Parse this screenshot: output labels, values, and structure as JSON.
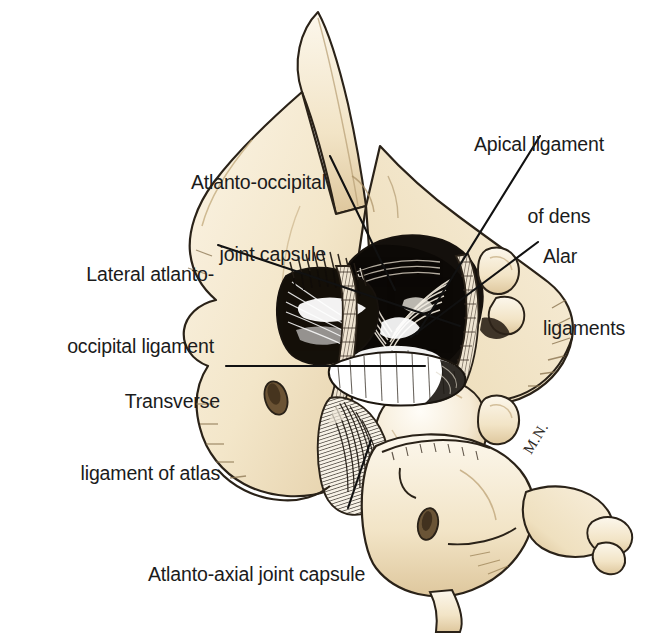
{
  "figure": {
    "kind": "anatomical-illustration",
    "signature": "M.N.",
    "background_color": "#FFFFFF",
    "ink_color": "#1B1B1B",
    "bone_fill": "#F4E7CD",
    "bone_fill_light": "#FAF3E4",
    "bone_fill_shadow": "#E2CEA8",
    "cavity_color": "#14100C",
    "ligament_white": "#FFFFFF"
  },
  "labels": [
    {
      "id": "atlanto-occipital-joint-capsule",
      "lines": [
        "Atlanto-occipital",
        "joint capsule"
      ],
      "align": "right",
      "x": 104,
      "y": 122,
      "width": 222,
      "leader": {
        "x1": 330,
        "y1": 156,
        "x2": 395,
        "y2": 290
      }
    },
    {
      "id": "lateral-atlanto-occipital-ligament",
      "lines": [
        "Lateral atlanto-",
        "occipital ligament"
      ],
      "align": "right",
      "x": 32,
      "y": 214,
      "width": 182,
      "leader": {
        "x1": 218,
        "y1": 245,
        "x2": 460,
        "y2": 326
      }
    },
    {
      "id": "transverse-ligament-of-atlas",
      "lines": [
        "Transverse",
        "ligament of atlas"
      ],
      "align": "right",
      "x": 52,
      "y": 341,
      "width": 168,
      "leader": {
        "x1": 226,
        "y1": 366,
        "x2": 425,
        "y2": 366
      }
    },
    {
      "id": "atlanto-axial-joint-capsule",
      "lines": [
        "Atlanto-axial joint capsule"
      ],
      "align": "left",
      "x": 148,
      "y": 514,
      "width": 262,
      "leader": {
        "x1": 348,
        "y1": 508,
        "x2": 371,
        "y2": 440
      }
    },
    {
      "id": "apical-ligament-of-dens",
      "lines": [
        "Apical ligament",
        "of dens"
      ],
      "align": "left",
      "x": 474,
      "y": 84,
      "width": 160,
      "leader": {
        "x1": 540,
        "y1": 136,
        "x2": 417,
        "y2": 334
      }
    },
    {
      "id": "alar-ligaments",
      "lines": [
        "Alar",
        "ligaments"
      ],
      "align": "left",
      "x": 543,
      "y": 196,
      "width": 100,
      "leader": {
        "x1": 538,
        "y1": 242,
        "x2": 411,
        "y2": 337
      }
    }
  ],
  "signature_mark": {
    "text": "M.N.",
    "x": 520,
    "y": 448,
    "rotation_deg": -58
  }
}
